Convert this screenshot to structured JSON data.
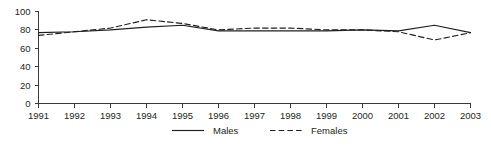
{
  "chart_data": {
    "type": "line",
    "title": "",
    "subtitle": "",
    "xlabel": "",
    "ylabel": "",
    "grid": false,
    "legend_position": "bottom-center",
    "categories": [
      "1991",
      "1992",
      "1993",
      "1994",
      "1995",
      "1996",
      "1997",
      "1998",
      "1999",
      "2000",
      "2001",
      "2002",
      "2003"
    ],
    "x": [
      1991,
      1992,
      1993,
      1994,
      1995,
      1996,
      1997,
      1998,
      1999,
      2000,
      2001,
      2002,
      2003
    ],
    "xlim": [
      1991,
      2003
    ],
    "ylim": [
      0,
      100
    ],
    "yticks": [
      0,
      20,
      40,
      60,
      80,
      100
    ],
    "ytick_labels": [
      "0",
      "20",
      "40",
      "60",
      "80",
      "100"
    ],
    "series": [
      {
        "name": "Males",
        "style": "solid",
        "color": "#231f20",
        "values": [
          77,
          78,
          80,
          83,
          85,
          79,
          79,
          79,
          79,
          80,
          79,
          85,
          77
        ]
      },
      {
        "name": "Females",
        "style": "dashed",
        "color": "#231f20",
        "values": [
          74,
          78,
          82,
          91,
          87,
          80,
          82,
          82,
          80,
          80,
          78,
          69,
          77
        ]
      }
    ]
  },
  "axis": {
    "y_tick_labels": [
      "100",
      "80",
      "60",
      "40",
      "20",
      "0"
    ],
    "x_tick_labels": [
      "1991",
      "1992",
      "1993",
      "1994",
      "1995",
      "1996",
      "1997",
      "1998",
      "1999",
      "2000",
      "2001",
      "2002",
      "2003"
    ]
  },
  "legend": {
    "items": [
      {
        "label": "Males",
        "style": "solid"
      },
      {
        "label": "Females",
        "style": "dashed"
      }
    ]
  }
}
